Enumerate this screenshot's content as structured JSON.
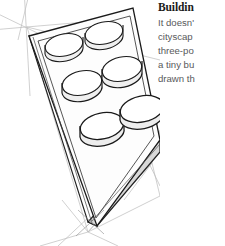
{
  "page": {
    "background_color": "#ffffff",
    "width": 225,
    "height": 246
  },
  "article": {
    "heading": "Buildin",
    "lines": [
      "It doesn'",
      "cityscap",
      "three-po",
      "a tiny bu",
      "drawn th"
    ],
    "heading_color": "#1b1b1b",
    "body_color": "#58595b"
  },
  "illustration": {
    "name": "lego-brick-perspective-sketch",
    "description": "Pencil sketch of a six-stud toy building brick drawn in three-point perspective with construction guide lines",
    "colors": {
      "outline": "#1a1a1a",
      "construction_line": "#b9b9b9",
      "top_face_fill": "#fdfdfd",
      "front_face_fill": "#d8d8d8",
      "side_face_fill": "#ffffff",
      "stud_fill": "#ffffff",
      "stud_shadow": "#e9e9e9"
    },
    "studs": [
      {
        "label": "stud-1",
        "cx": 64,
        "cy": 47
      },
      {
        "label": "stud-2",
        "cx": 104,
        "cy": 35
      },
      {
        "label": "stud-3",
        "cx": 82,
        "cy": 85
      },
      {
        "label": "stud-4",
        "cx": 122,
        "cy": 71
      },
      {
        "label": "stud-5",
        "cx": 102,
        "cy": 128
      },
      {
        "label": "stud-6",
        "cx": 142,
        "cy": 111
      }
    ],
    "vanishing_points": [
      {
        "label": "vanishing-point-upper-left",
        "x": 27,
        "y": 27
      },
      {
        "label": "vanishing-point-lower",
        "x": 88,
        "y": 232
      },
      {
        "label": "vanishing-point-right",
        "x": 152,
        "y": 163
      }
    ]
  }
}
